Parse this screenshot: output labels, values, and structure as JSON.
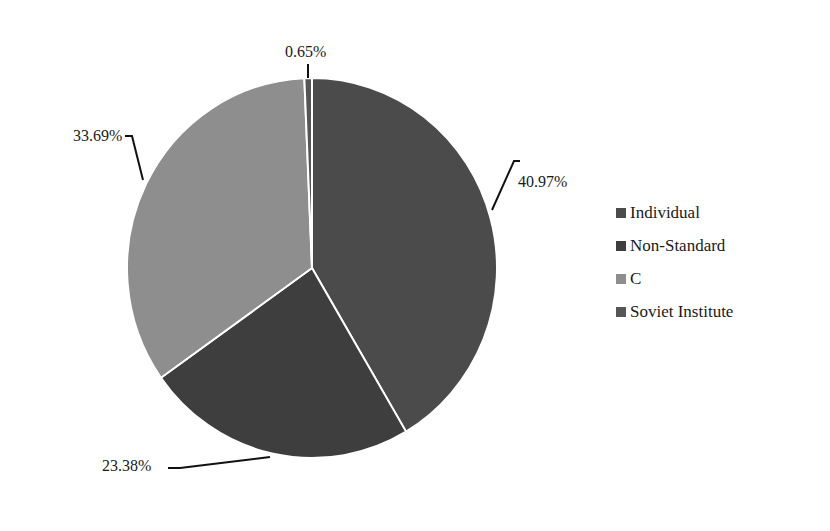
{
  "chart_data": {
    "type": "pie",
    "title": "",
    "categories": [
      "Individual",
      "Non-Standard",
      "C",
      "Soviet Institute"
    ],
    "values": [
      40.97,
      23.38,
      33.69,
      0.65
    ],
    "labels": [
      "40.97%",
      "23.38%",
      "33.69%",
      "0.65%"
    ],
    "colors": [
      "#4b4b4b",
      "#3e3e3e",
      "#8e8e8e",
      "#555555"
    ],
    "start_angle": "12 o'clock, clockwise",
    "legend_position": "right"
  },
  "legend": {
    "items": [
      {
        "label": "Individual",
        "color": "#4b4b4b"
      },
      {
        "label": "Non-Standard",
        "color": "#3e3e3e"
      },
      {
        "label": "C",
        "color": "#8e8e8e"
      },
      {
        "label": "Soviet Institute",
        "color": "#555555"
      }
    ]
  },
  "data_labels": {
    "individual": "40.97%",
    "non_standard": "23.38%",
    "c": "33.69%",
    "soviet_institute": "0.65%"
  }
}
